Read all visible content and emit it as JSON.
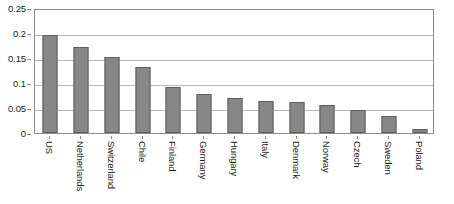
{
  "chart_data": {
    "type": "bar",
    "title": "",
    "subtitle": "",
    "xlabel": "",
    "ylabel": "",
    "categories": [
      "US",
      "Netherlands",
      "Switzerland",
      "Chile",
      "Finland",
      "Germany",
      "Hungary",
      "Italy",
      "Denmark",
      "Norway",
      "Czech",
      "Sweden",
      "Poland"
    ],
    "values": [
      0.196,
      0.172,
      0.152,
      0.133,
      0.092,
      0.078,
      0.07,
      0.065,
      0.063,
      0.056,
      0.047,
      0.034,
      0.009
    ],
    "ylim": [
      0,
      0.25
    ],
    "yticks": [
      0,
      0.05,
      0.1,
      0.15,
      0.2,
      0.25
    ],
    "ytick_labels": [
      "0",
      "0.05",
      "0.1",
      "0.15",
      "0.2",
      "0.25"
    ],
    "grid": true,
    "grid_axis": "y",
    "legend": false,
    "legend_position": "none",
    "bar_color": "#878787",
    "bar_edge_color": "#5e5e5e",
    "gridline_color": "#b9b9b9",
    "axis_color": "#8c8c8c",
    "plot_background": "#ffffff",
    "xtick_rotation": 90
  }
}
